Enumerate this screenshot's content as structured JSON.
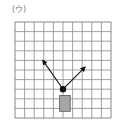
{
  "figure": {
    "label": "(ウ)",
    "grid": {
      "columns": 10,
      "rows": 10,
      "origin_px": [
        15,
        22
      ],
      "cell_px": 9.6,
      "line_color": "#8a8a8a",
      "border_color": "#6a6a6a"
    },
    "block": {
      "shape": "rectangle",
      "fill": "#a6a6a6",
      "stroke": "#555555",
      "grid_x": [
        4.65,
        5.75
      ],
      "grid_y": [
        7.65,
        9.3
      ]
    },
    "pivot": {
      "shape": "dot",
      "fill": "#111111",
      "grid_pos": [
        5,
        7
      ]
    },
    "arrows": [
      {
        "name": "left-arrow",
        "from": [
          5,
          7
        ],
        "to": [
          2.9,
          4.0
        ],
        "color": "#111111"
      },
      {
        "name": "right-arrow",
        "from": [
          5,
          7
        ],
        "to": [
          7.3,
          4.7
        ],
        "color": "#111111"
      }
    ]
  }
}
